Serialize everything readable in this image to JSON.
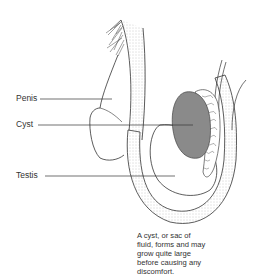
{
  "labels": {
    "penis": "Penis",
    "cyst": "Cyst",
    "testis": "Testis"
  },
  "caption": {
    "lines": [
      "A cyst, or sac of",
      "fluid, forms and may",
      "grow quite large",
      "before causing any",
      "discomfort."
    ]
  },
  "colors": {
    "cyst_fill": "#8a8a8a",
    "outline": "#333333",
    "stipple": "#e6e6e6"
  }
}
